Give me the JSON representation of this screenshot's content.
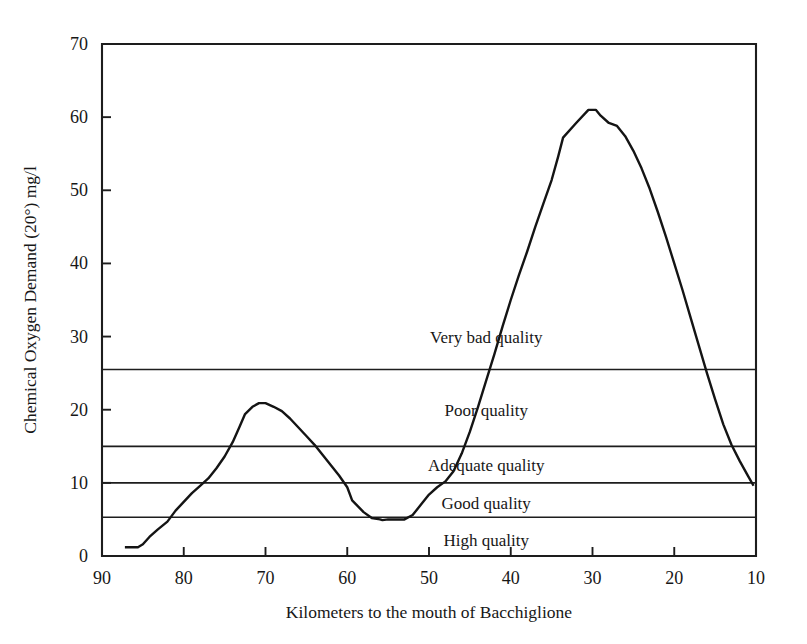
{
  "chart_data": {
    "type": "line",
    "title": "",
    "xlabel": "Kilometers to the mouth of Bacchiglione",
    "ylabel": "Chemical Oxygen Demand (20°) mg/l",
    "xlim": [
      90,
      10
    ],
    "ylim": [
      0,
      70
    ],
    "x_ticks": [
      90,
      80,
      70,
      60,
      50,
      40,
      30,
      20,
      10
    ],
    "y_ticks": [
      0,
      10,
      20,
      30,
      40,
      50,
      60,
      70
    ],
    "x_reversed": true,
    "grid": false,
    "legend": "none",
    "series": [
      {
        "name": "Chemical Oxygen Demand",
        "x": [
          87.2,
          85.6,
          85.0,
          84.2,
          83.2,
          82.0,
          81.0,
          80.0,
          79.0,
          78.0,
          77.0,
          76.0,
          75.0,
          74.0,
          73.2,
          72.5,
          71.6,
          70.8,
          70.0,
          69.0,
          68.0,
          67.0,
          66.0,
          65.0,
          64.0,
          63.0,
          62.0,
          61.0,
          60.0,
          59.4,
          58.0,
          57.0,
          56.0,
          55.7,
          55.0,
          54.0,
          53.0,
          52.0,
          51.0,
          50.0,
          49.0,
          48.0,
          47.0,
          46.0,
          45.0,
          44.0,
          43.0,
          42.0,
          41.0,
          40.0,
          39.0,
          38.0,
          37.0,
          36.0,
          35.0,
          34.2,
          33.6,
          32.0,
          30.5,
          29.6,
          29.0,
          28.0,
          27.0,
          26.0,
          25.0,
          24.0,
          23.0,
          22.0,
          21.0,
          20.0,
          19.0,
          18.0,
          17.0,
          16.0,
          15.0,
          14.0,
          13.0,
          12.0,
          11.0,
          10.3
        ],
        "y": [
          1.2,
          1.2,
          1.6,
          2.6,
          3.6,
          4.7,
          6.2,
          7.4,
          8.6,
          9.6,
          10.6,
          12.0,
          13.6,
          15.6,
          17.6,
          19.4,
          20.4,
          20.9,
          20.9,
          20.4,
          19.8,
          18.8,
          17.6,
          16.4,
          15.2,
          13.8,
          12.4,
          11.0,
          9.4,
          7.6,
          6.0,
          5.2,
          5.0,
          4.9,
          5.0,
          5.0,
          5.0,
          5.6,
          7.0,
          8.4,
          9.4,
          10.2,
          11.6,
          14.0,
          17.0,
          20.4,
          24.0,
          27.6,
          31.4,
          35.0,
          38.4,
          41.6,
          45.0,
          48.2,
          51.4,
          54.6,
          57.2,
          59.2,
          61.0,
          61.0,
          60.2,
          59.2,
          58.8,
          57.4,
          55.4,
          53.0,
          50.2,
          47.0,
          43.6,
          40.0,
          36.4,
          32.6,
          28.8,
          25.0,
          21.4,
          18.0,
          15.2,
          13.0,
          11.0,
          9.6
        ]
      }
    ],
    "thresholds": [
      {
        "value": 25.5,
        "label": "Very bad quality",
        "band_label_y": 30.0,
        "label_x": 43.0
      },
      {
        "value": 15.0,
        "label": "Poor quality",
        "band_label_y": 20.0,
        "label_x": 43.0
      },
      {
        "value": 10.0,
        "label": "Adequate quality",
        "band_label_y": 12.4,
        "label_x": 43.0
      },
      {
        "value": 5.3,
        "label": "Good quality",
        "band_label_y": 7.2,
        "label_x": 43.0
      },
      {
        "value": 0.0,
        "label": "High quality",
        "band_label_y": 2.2,
        "label_x": 43.0
      }
    ],
    "band_labels": [
      "Very bad quality",
      "Poor quality",
      "Adequate quality",
      "Good quality",
      "High quality"
    ],
    "colors": {
      "line": "#141414",
      "axis": "#1d1d1d",
      "background": "#ffffff",
      "text": "#171717"
    }
  }
}
